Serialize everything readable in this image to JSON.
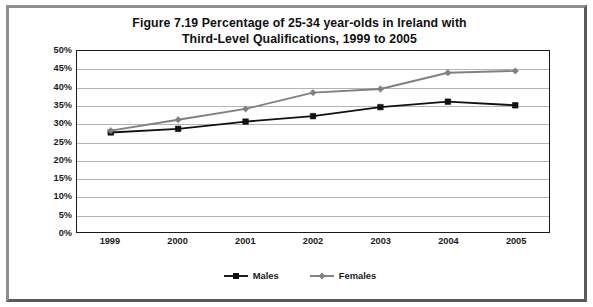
{
  "figure": {
    "title_line1": "Figure 7.19   Percentage of 25-34 year-olds in Ireland with",
    "title_line2": "Third-Level Qualifications, 1999 to 2005"
  },
  "chart_data": {
    "type": "line",
    "title": "Figure 7.19   Percentage of 25-34 year-olds in Ireland with Third-Level Qualifications, 1999 to 2005",
    "xlabel": "",
    "ylabel": "",
    "categories": [
      "1999",
      "2000",
      "2001",
      "2002",
      "2003",
      "2004",
      "2005"
    ],
    "series": [
      {
        "name": "Males",
        "color": "#111111",
        "marker": "square",
        "values": [
          27.5,
          28.5,
          30.5,
          32.0,
          34.5,
          36.0,
          35.0
        ]
      },
      {
        "name": "Females",
        "color": "#808080",
        "marker": "diamond",
        "values": [
          28.0,
          31.0,
          34.0,
          38.5,
          39.5,
          44.0,
          44.5
        ]
      }
    ],
    "ylim": [
      0,
      50
    ],
    "ytick_labels": [
      "50%",
      "45%",
      "40%",
      "35%",
      "30%",
      "25%",
      "20%",
      "15%",
      "10%",
      "5%",
      "0%"
    ],
    "ytick_values": [
      50,
      45,
      40,
      35,
      30,
      25,
      20,
      15,
      10,
      5,
      0
    ],
    "grid": true,
    "legend_position": "bottom"
  },
  "legend": {
    "entries": [
      {
        "label": "Males",
        "color": "#111111",
        "marker": "square"
      },
      {
        "label": "Females",
        "color": "#808080",
        "marker": "diamond"
      }
    ]
  },
  "colors": {
    "males_line": "#111111",
    "females_line": "#808080",
    "gridline": "#b4b4b4",
    "axis": "#1a1a1a",
    "plot_background": "#ffffff",
    "frame_light": "#8f8f8f",
    "frame_dark": "#5a5a5a"
  }
}
